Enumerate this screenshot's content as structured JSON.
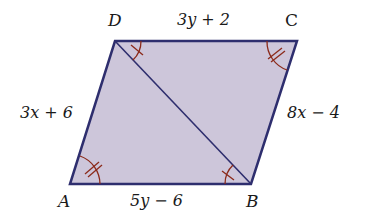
{
  "figure": {
    "type": "parallelogram",
    "fill_color": "#cdc6da",
    "edge_color": "#2e2e6e",
    "mark_color": "#8b2a1a",
    "vertices": {
      "A": {
        "label": "A",
        "x": 70,
        "y": 184
      },
      "B": {
        "label": "B",
        "x": 251,
        "y": 184
      },
      "C": {
        "label": "C",
        "x": 297,
        "y": 41
      },
      "D": {
        "label": "D",
        "x": 115,
        "y": 41
      }
    },
    "diagonal": {
      "from": "D",
      "to": "B"
    },
    "side_labels": {
      "DC": "3y + 2",
      "AD": "3x + 6",
      "CB": "8x − 4",
      "AB": "5y − 6"
    },
    "angle_marks": [
      {
        "vertex": "D",
        "angle": "ADB... wait",
        "ticks": 1
      },
      {
        "vertex": "B",
        "ticks": 1
      },
      {
        "vertex": "A",
        "ticks": 2
      },
      {
        "vertex": "C",
        "ticks": 2
      }
    ]
  }
}
